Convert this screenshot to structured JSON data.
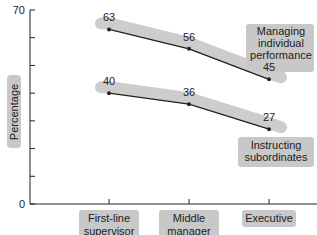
{
  "chart_data": {
    "type": "line",
    "title": "",
    "xlabel": "",
    "ylabel": "Percentage",
    "ylim": [
      0,
      70
    ],
    "y_ticks": [
      "0",
      "70"
    ],
    "y_minor_step": 10,
    "categories": [
      "First-line supervisor",
      "Middle manager",
      "Executive"
    ],
    "category_lines": [
      [
        "First-line",
        "supervisor"
      ],
      [
        "Middle",
        "manager"
      ],
      [
        "Executive"
      ]
    ],
    "series": [
      {
        "name": "Managing individual performance",
        "label_lines": [
          "Managing",
          "individual",
          "performance"
        ],
        "values": [
          63,
          56,
          45
        ]
      },
      {
        "name": "Instructing subordinates",
        "label_lines": [
          "Instructing",
          "subordinates"
        ],
        "values": [
          40,
          36,
          27
        ]
      }
    ],
    "grid": false,
    "legend": "inline labels at right",
    "colors": {
      "line": "#222222",
      "highlight": "#c8c8c8"
    }
  }
}
